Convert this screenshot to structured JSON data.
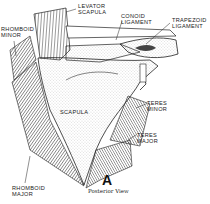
{
  "figure": {
    "letter": "A",
    "caption": "Posterior View",
    "labels": {
      "levator_scapula": "LEVATOR\nSCAPULA",
      "conoid_ligament": "CONOID\nLIGAMENT",
      "trapezoid_ligament": "TRAPEZOID\nLIGAMENT",
      "rhomboid_minor": "RHOMBOID\nMINOR",
      "scapula": "SCAPULA",
      "teres_minor": "TERES\nMINOR",
      "teres_major": "TERES\nMAJOR",
      "rhomboid_major": "RHOMBOID\nMAJOR"
    }
  }
}
